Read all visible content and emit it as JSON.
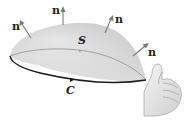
{
  "diagram": {
    "surface": {
      "label": "S",
      "fill_top": "#d6d6d6",
      "fill_bottom": "#efefef",
      "rim_color": "#9a9a9a"
    },
    "boundary_curve": {
      "label": "C",
      "color": "#1a1a1a",
      "orientation": "counterclockwise (arrow pointing right on front edge)"
    },
    "normal_vectors": [
      {
        "label": "n",
        "position": "left"
      },
      {
        "label": "n",
        "position": "top"
      },
      {
        "label": "n",
        "position": "upper-right"
      },
      {
        "label": "n",
        "position": "right"
      }
    ],
    "arrow_color": "#7a7a7a",
    "hand": {
      "description": "right hand with thumb up",
      "skin_color": "#e8e8e8"
    }
  }
}
